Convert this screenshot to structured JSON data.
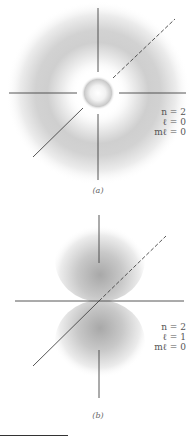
{
  "figures": [
    {
      "id": "a",
      "caption": "(a)",
      "labels": [
        "n = 2",
        "ℓ = 0",
        "mℓ = 0"
      ],
      "n": "2",
      "l": "0",
      "ml": "0",
      "shape": "spherical shell with inner core (2s orbital)"
    },
    {
      "id": "b",
      "caption": "(b)",
      "labels": [
        "n = 2",
        "ℓ = 1",
        "mℓ = 0"
      ],
      "n": "2",
      "l": "1",
      "ml": "0",
      "shape": "two lobes along vertical axis (2p orbital)"
    }
  ],
  "colors": {
    "axis": "#444444",
    "density": "#9a9a9a",
    "background": "#ffffff"
  }
}
